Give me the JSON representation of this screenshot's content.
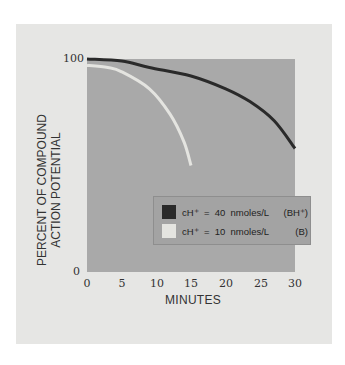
{
  "chart_data": {
    "type": "line",
    "title": "",
    "xlabel": "MINUTES",
    "ylabel": [
      "PERCENT OF COMPOUND",
      "ACTION POTENTIAL"
    ],
    "xlim": [
      0,
      30
    ],
    "ylim": [
      0,
      100
    ],
    "x_ticks": [
      "0",
      "5",
      "10",
      "15",
      "20",
      "25",
      "30"
    ],
    "y_ticks": [
      "0",
      "100"
    ],
    "grid": false,
    "legend_position": "lower right inside plot",
    "series": [
      {
        "name": "cH+ = 40 nmoles/L (BH+)",
        "color": "#2a2a2a",
        "x": [
          0,
          5,
          9,
          15,
          20,
          23.5,
          27,
          30
        ],
        "y": [
          100,
          99,
          96,
          92,
          86,
          80,
          71,
          58
        ]
      },
      {
        "name": "cH+ = 10 nmoles/L (B)",
        "color": "#e4e4e0",
        "x": [
          0,
          3,
          5,
          9,
          12,
          14,
          15
        ],
        "y": [
          97,
          96,
          94,
          86,
          74,
          61,
          50
        ]
      }
    ]
  },
  "axes": {
    "y_top": "100",
    "y_bottom": "0",
    "x_ticks": [
      "0",
      "5",
      "10",
      "15",
      "20",
      "25",
      "30"
    ],
    "xlabel": "MINUTES",
    "ylabel_line1": "PERCENT OF COMPOUND",
    "ylabel_line2": "ACTION POTENTIAL"
  },
  "legend": {
    "items": [
      {
        "text": "cH⁺  =  40  nmoles/L",
        "tag": "(BH⁺)",
        "color": "#2a2a2a"
      },
      {
        "text": "cH⁺  =  10  nmoles/L",
        "tag": "(B)",
        "color": "#e4e4e0"
      }
    ]
  },
  "colors": {
    "panel": "#e6e6e4",
    "plot_area": "#a9a9a9",
    "legend_bg": "#a3a3a3"
  }
}
